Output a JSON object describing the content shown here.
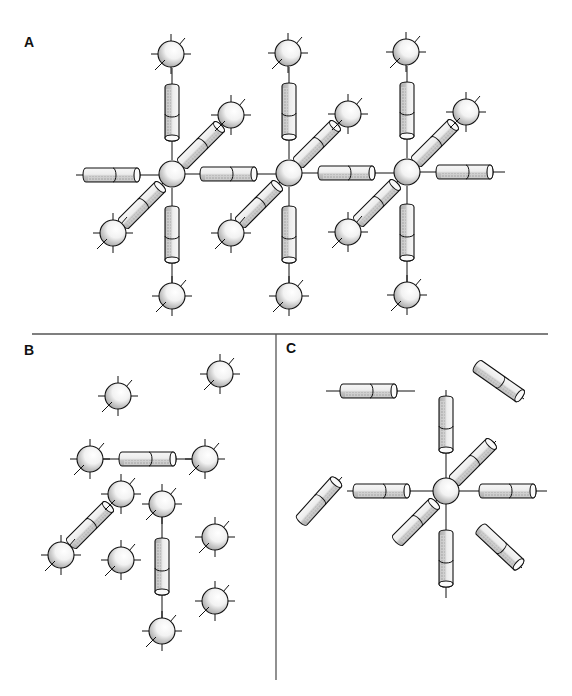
{
  "figure": {
    "panels": [
      {
        "id": "A",
        "label": "A",
        "label_pos": [
          31,
          50
        ]
      },
      {
        "id": "B",
        "label": "B",
        "label_pos": [
          31,
          357
        ]
      },
      {
        "id": "C",
        "label": "C",
        "label_pos": [
          292,
          356
        ]
      }
    ],
    "dividers": {
      "horizontal": {
        "x1": 32,
        "x2": 548,
        "y": 334
      },
      "vertical": {
        "x": 276,
        "y1": 334,
        "y2": 680
      }
    },
    "colors": {
      "stroke": "#111111",
      "fill_light": "#f4f4f4",
      "fill_shade": "#b8b8b8",
      "divider": "#555555"
    },
    "sphere_radius": 13,
    "cylinder": {
      "length": 54,
      "thickness": 14
    },
    "panel_A": {
      "description": "Three linked lattice nodes; each central sphere connected via rod-shaped spacers to six neighboring spheres",
      "centers": [
        [
          172,
          174
        ],
        [
          289,
          173
        ],
        [
          407,
          172
        ]
      ],
      "outer_spheres": [
        [
          171,
          54
        ],
        [
          288,
          53
        ],
        [
          406,
          52
        ],
        [
          231,
          115
        ],
        [
          348,
          114
        ],
        [
          466,
          112
        ],
        [
          113,
          233
        ],
        [
          231,
          233
        ],
        [
          348,
          232
        ],
        [
          172,
          296
        ],
        [
          289,
          296
        ],
        [
          407,
          295
        ]
      ],
      "rods": [
        {
          "x1": 172,
          "y1": 68,
          "x2": 172,
          "y2": 160,
          "cx": 172,
          "cy": 114,
          "angle": 90
        },
        {
          "x1": 289,
          "y1": 67,
          "x2": 289,
          "y2": 159,
          "cx": 289,
          "cy": 113,
          "angle": 90
        },
        {
          "x1": 407,
          "y1": 66,
          "x2": 407,
          "y2": 158,
          "cx": 407,
          "cy": 112,
          "angle": 90
        },
        {
          "x1": 172,
          "y1": 188,
          "x2": 172,
          "y2": 283,
          "cx": 172,
          "cy": 236,
          "angle": 90
        },
        {
          "x1": 289,
          "y1": 187,
          "x2": 289,
          "y2": 283,
          "cx": 289,
          "cy": 236,
          "angle": 90
        },
        {
          "x1": 407,
          "y1": 186,
          "x2": 407,
          "y2": 282,
          "cx": 407,
          "cy": 234,
          "angle": 90
        },
        {
          "x1": 76,
          "y1": 175,
          "x2": 159,
          "y2": 175,
          "cx": 113,
          "cy": 175,
          "angle": 0
        },
        {
          "x1": 185,
          "y1": 174,
          "x2": 276,
          "y2": 174,
          "cx": 230,
          "cy": 174,
          "angle": 0
        },
        {
          "x1": 302,
          "y1": 173,
          "x2": 394,
          "y2": 173,
          "cx": 348,
          "cy": 173,
          "angle": 0
        },
        {
          "x1": 420,
          "y1": 172,
          "x2": 505,
          "y2": 172,
          "cx": 466,
          "cy": 172,
          "angle": 0
        },
        {
          "x1": 181,
          "y1": 165,
          "x2": 222,
          "y2": 124,
          "cx": 202,
          "cy": 144,
          "angle": -45
        },
        {
          "x1": 298,
          "y1": 164,
          "x2": 339,
          "y2": 123,
          "cx": 318,
          "cy": 143,
          "angle": -45
        },
        {
          "x1": 416,
          "y1": 163,
          "x2": 457,
          "y2": 121,
          "cx": 436,
          "cy": 142,
          "angle": -45
        },
        {
          "x1": 163,
          "y1": 183,
          "x2": 122,
          "y2": 224,
          "cx": 143,
          "cy": 204,
          "angle": -45
        },
        {
          "x1": 280,
          "y1": 182,
          "x2": 240,
          "y2": 224,
          "cx": 260,
          "cy": 203,
          "angle": -45
        },
        {
          "x1": 398,
          "y1": 181,
          "x2": 357,
          "y2": 223,
          "cx": 378,
          "cy": 202,
          "angle": -45
        }
      ]
    },
    "panel_B": {
      "description": "Disordered spheres with a few rod-shaped connectors forming partial links",
      "spheres": [
        [
          118,
          396
        ],
        [
          220,
          374
        ],
        [
          90,
          459
        ],
        [
          205,
          459
        ],
        [
          121,
          494
        ],
        [
          162,
          504
        ],
        [
          61,
          555
        ],
        [
          121,
          560
        ],
        [
          215,
          537
        ],
        [
          215,
          601
        ],
        [
          162,
          631
        ]
      ],
      "rods": [
        {
          "x1": 103,
          "y1": 459,
          "x2": 192,
          "y2": 459,
          "cx": 149,
          "cy": 459,
          "angle": 0
        },
        {
          "x1": 112,
          "y1": 503,
          "x2": 70,
          "y2": 546,
          "cx": 91,
          "cy": 524,
          "angle": -45
        },
        {
          "x1": 162,
          "y1": 517,
          "x2": 162,
          "y2": 618,
          "cx": 162,
          "cy": 568,
          "angle": 90
        }
      ]
    },
    "panel_C": {
      "description": "Single central sphere bonded to six rods, with four free-floating rods",
      "center": [
        446,
        491
      ],
      "rods": [
        {
          "x1": 446,
          "y1": 390,
          "x2": 446,
          "y2": 478,
          "cx": 446,
          "cy": 426,
          "angle": 90
        },
        {
          "x1": 446,
          "y1": 504,
          "x2": 446,
          "y2": 598,
          "cx": 446,
          "cy": 560,
          "angle": 90
        },
        {
          "x1": 347,
          "y1": 491,
          "x2": 433,
          "y2": 491,
          "cx": 383,
          "cy": 491,
          "angle": 0
        },
        {
          "x1": 459,
          "y1": 491,
          "x2": 547,
          "y2": 491,
          "cx": 509,
          "cy": 491,
          "angle": 0
        },
        {
          "x1": 455,
          "y1": 482,
          "x2": 496,
          "y2": 441,
          "cx": 474,
          "cy": 461,
          "angle": -45
        },
        {
          "x1": 437,
          "y1": 500,
          "x2": 396,
          "y2": 541,
          "cx": 417,
          "cy": 521,
          "angle": -45
        }
      ],
      "free_rods": [
        {
          "x1": 326,
          "y1": 391,
          "x2": 415,
          "y2": 391,
          "cx": 370,
          "cy": 391,
          "angle": 0
        },
        {
          "x1": 476,
          "y1": 365,
          "x2": 524,
          "y2": 399,
          "cx": 500,
          "cy": 382,
          "angle": 35
        },
        {
          "x1": 342,
          "y1": 477,
          "x2": 301,
          "y2": 523,
          "cx": 320,
          "cy": 500,
          "angle": -48
        },
        {
          "x1": 480,
          "y1": 529,
          "x2": 522,
          "y2": 568,
          "cx": 501,
          "cy": 548,
          "angle": 43
        }
      ]
    }
  }
}
